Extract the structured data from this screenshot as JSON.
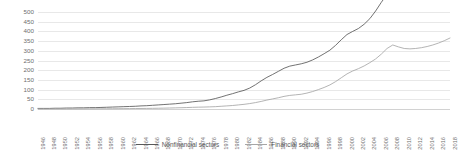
{
  "chart_data": {
    "type": "line",
    "title": "",
    "xlabel": "",
    "ylabel": "",
    "ylim": [
      0,
      500
    ],
    "yticks": [
      0,
      50,
      100,
      150,
      200,
      250,
      300,
      350,
      400,
      450,
      500
    ],
    "grid": true,
    "legend_position": "bottom",
    "xlim": [
      1946,
      2018
    ],
    "x": [
      1946,
      1947,
      1948,
      1949,
      1950,
      1951,
      1952,
      1953,
      1954,
      1955,
      1956,
      1957,
      1958,
      1959,
      1960,
      1961,
      1962,
      1963,
      1964,
      1965,
      1966,
      1967,
      1968,
      1969,
      1970,
      1971,
      1972,
      1973,
      1974,
      1975,
      1976,
      1977,
      1978,
      1979,
      1980,
      1981,
      1982,
      1983,
      1984,
      1985,
      1986,
      1987,
      1988,
      1989,
      1990,
      1991,
      1992,
      1993,
      1994,
      1995,
      1996,
      1997,
      1998,
      1999,
      2000,
      2001,
      2002,
      2003,
      2004,
      2005,
      2006,
      2007,
      2008,
      2009,
      2010,
      2011,
      2012,
      2013,
      2014,
      2015,
      2016,
      2017,
      2018
    ],
    "xticks": [
      1946,
      1948,
      1950,
      1952,
      1954,
      1956,
      1958,
      1960,
      1962,
      1964,
      1966,
      1968,
      1970,
      1972,
      1974,
      1976,
      1978,
      1980,
      1982,
      1984,
      1986,
      1988,
      1990,
      1992,
      1994,
      1996,
      1998,
      2000,
      2002,
      2004,
      2006,
      2008,
      2010,
      2012,
      2014,
      2016,
      2018
    ],
    "series": [
      {
        "name": "Nonfinancial sectors",
        "color": "#595959",
        "values": [
          3,
          3,
          3,
          4,
          4,
          5,
          5,
          6,
          6,
          7,
          7,
          8,
          9,
          10,
          11,
          12,
          13,
          14,
          16,
          17,
          19,
          21,
          23,
          25,
          27,
          30,
          33,
          37,
          40,
          42,
          47,
          54,
          62,
          71,
          79,
          88,
          96,
          108,
          125,
          145,
          163,
          178,
          194,
          210,
          221,
          227,
          233,
          241,
          253,
          268,
          285,
          303,
          328,
          357,
          384,
          400,
          415,
          437,
          466,
          505,
          550,
          591,
          611,
          592,
          590,
          599,
          613,
          628,
          650,
          672,
          694,
          721,
          752
        ]
      },
      {
        "name": "Financial sectors",
        "color": "#a6a6a6",
        "values": [
          0.2,
          0.2,
          0.3,
          0.3,
          0.4,
          0.4,
          0.5,
          0.6,
          0.7,
          0.8,
          0.9,
          1,
          1.2,
          1.4,
          1.6,
          1.8,
          2.1,
          2.4,
          2.7,
          3,
          3.4,
          3.9,
          4.4,
          5.1,
          5.8,
          6.6,
          7.5,
          8.6,
          9.5,
          10,
          11,
          12,
          14,
          16,
          18,
          21,
          24,
          28,
          33,
          39,
          46,
          52,
          58,
          65,
          70,
          73,
          76,
          82,
          90,
          100,
          111,
          124,
          141,
          161,
          181,
          196,
          208,
          222,
          239,
          258,
          283,
          312,
          330,
          320,
          312,
          310,
          312,
          316,
          322,
          330,
          340,
          352,
          366
        ]
      }
    ]
  },
  "axis": {
    "y_tick_labels": [
      "0",
      "50",
      "100",
      "150",
      "200",
      "250",
      "300",
      "350",
      "400",
      "450",
      "500"
    ],
    "x_tick_labels": [
      "1946",
      "1948",
      "1950",
      "1952",
      "1954",
      "1956",
      "1958",
      "1960",
      "1962",
      "1964",
      "1966",
      "1968",
      "1970",
      "1972",
      "1974",
      "1976",
      "1978",
      "1980",
      "1982",
      "1984",
      "1986",
      "1988",
      "1990",
      "1992",
      "1994",
      "1996",
      "1998",
      "2000",
      "2002",
      "2004",
      "2006",
      "2008",
      "2010",
      "2012",
      "2014",
      "2016",
      "2018"
    ]
  },
  "legend": {
    "items": [
      {
        "label": "Nonfinancial sectors",
        "color": "#595959"
      },
      {
        "label": "Financial sectors",
        "color": "#a6a6a6"
      }
    ]
  }
}
